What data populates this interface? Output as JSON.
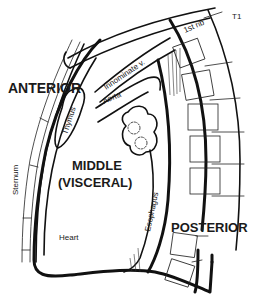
{
  "diagram": {
    "regions": {
      "anterior": "ANTERIOR",
      "middle_line1": "MIDDLE",
      "middle_line2": "(VISCERAL)",
      "posterior": "POSTERIOR"
    },
    "structures": {
      "first_rib": "1st rib",
      "t1": "T1",
      "innominate_vessel": "Innominate v.",
      "aorta": "Aorta",
      "thymus": "Thymus",
      "sternum": "Sternum",
      "heart": "Heart",
      "esophagus": "Esophagus"
    },
    "colors": {
      "ink": "#111111",
      "background": "#ffffff"
    }
  }
}
